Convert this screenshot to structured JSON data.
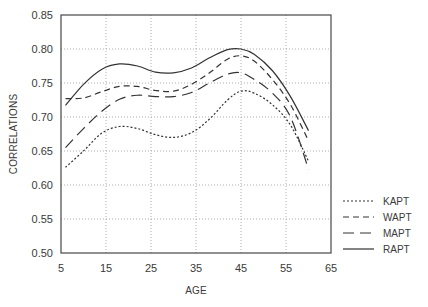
{
  "chart_data": {
    "type": "line",
    "title": "",
    "xlabel": "AGE",
    "ylabel": "CORRELATIONS",
    "xlim": [
      5,
      65
    ],
    "ylim": [
      0.5,
      0.85
    ],
    "xticks": [
      "5",
      "15",
      "25",
      "35",
      "45",
      "55",
      "65"
    ],
    "yticks": [
      "0.50",
      "0.55",
      "0.60",
      "0.65",
      "0.70",
      "0.75",
      "0.80",
      "0.85"
    ],
    "grid": true,
    "legend_position": "outside-right-bottom",
    "series": [
      {
        "name": "KAPT",
        "style": "dotted",
        "x": [
          6,
          10,
          14,
          18,
          22,
          26,
          30,
          34,
          38,
          42,
          45,
          48,
          52,
          56,
          60
        ],
        "y": [
          0.626,
          0.65,
          0.676,
          0.686,
          0.683,
          0.674,
          0.67,
          0.677,
          0.697,
          0.725,
          0.738,
          0.735,
          0.718,
          0.688,
          0.635
        ]
      },
      {
        "name": "WAPT",
        "style": "short-dash",
        "x": [
          6,
          10,
          14,
          18,
          22,
          26,
          30,
          34,
          38,
          42,
          45,
          48,
          52,
          56,
          60
        ],
        "y": [
          0.727,
          0.728,
          0.737,
          0.745,
          0.745,
          0.739,
          0.738,
          0.748,
          0.765,
          0.785,
          0.79,
          0.782,
          0.755,
          0.718,
          0.665
        ]
      },
      {
        "name": "MAPT",
        "style": "long-dash",
        "x": [
          6,
          10,
          14,
          18,
          22,
          26,
          30,
          34,
          38,
          42,
          45,
          48,
          52,
          56,
          60
        ],
        "y": [
          0.655,
          0.683,
          0.708,
          0.726,
          0.732,
          0.73,
          0.73,
          0.736,
          0.75,
          0.763,
          0.765,
          0.755,
          0.735,
          0.7,
          0.623
        ]
      },
      {
        "name": "RAPT",
        "style": "solid",
        "x": [
          6,
          10,
          14,
          18,
          22,
          26,
          30,
          34,
          38,
          42,
          45,
          48,
          52,
          56,
          60
        ],
        "y": [
          0.717,
          0.748,
          0.77,
          0.778,
          0.775,
          0.766,
          0.765,
          0.772,
          0.787,
          0.799,
          0.8,
          0.792,
          0.768,
          0.73,
          0.68
        ]
      }
    ]
  },
  "legend": {
    "items": [
      {
        "label": "KAPT"
      },
      {
        "label": "WAPT"
      },
      {
        "label": "MAPT"
      },
      {
        "label": "RAPT"
      }
    ]
  },
  "colors": {
    "line": "#333333",
    "frame": "#555555",
    "grid": "#9a9a9a",
    "text": "#3a3a3a"
  }
}
